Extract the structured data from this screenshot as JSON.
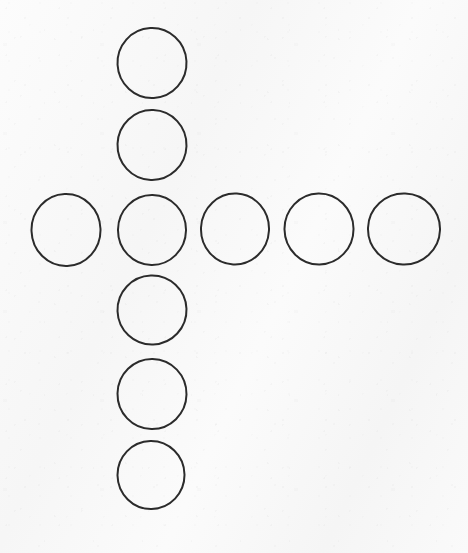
{
  "image": {
    "title": "Circles arranged in a cross",
    "description": "Hand-drawn diagram of nine open circles forming a plus / cross shape on lightly textured white paper",
    "width": 468,
    "height": 553,
    "background_color": "#fafafa",
    "stroke_color": "#2b2b2b",
    "stroke_width": 2
  },
  "chart_data": {
    "type": "scatter",
    "title": "Circles arranged in a cross",
    "xlabel": "",
    "ylabel": "",
    "xlim": [
      0,
      468
    ],
    "ylim": [
      0,
      553
    ],
    "grid": false,
    "legend": "none",
    "marker": "open-circle",
    "units": "pixels",
    "note": "Six circles form a vertical column; five circles form a horizontal row; they share the circle at (152, 230).",
    "counts": {
      "total_circles": 9,
      "vertical_column_circles": 6,
      "horizontal_row_circles": 5,
      "shared_intersection_circles": 1
    },
    "series": [
      {
        "name": "vertical-column",
        "points": [
          {
            "label": "column-1",
            "x": 152,
            "y": 63,
            "diameter": 69
          },
          {
            "label": "column-2",
            "x": 152,
            "y": 145,
            "diameter": 69
          },
          {
            "label": "column-3-intersection",
            "x": 152,
            "y": 230,
            "diameter": 69
          },
          {
            "label": "column-4",
            "x": 152,
            "y": 310,
            "diameter": 69
          },
          {
            "label": "column-5",
            "x": 152,
            "y": 394,
            "diameter": 69
          },
          {
            "label": "column-6",
            "x": 151,
            "y": 475,
            "diameter": 67
          }
        ]
      },
      {
        "name": "horizontal-row",
        "points": [
          {
            "label": "row-1",
            "x": 66,
            "y": 230,
            "diameter": 69
          },
          {
            "label": "row-2-intersection",
            "x": 152,
            "y": 230,
            "diameter": 69
          },
          {
            "label": "row-3",
            "x": 235,
            "y": 229,
            "diameter": 68
          },
          {
            "label": "row-4",
            "x": 319,
            "y": 229,
            "diameter": 69
          },
          {
            "label": "row-5",
            "x": 404,
            "y": 229,
            "diameter": 72
          }
        ]
      }
    ]
  },
  "circles": [
    {
      "name": "circle-column-top",
      "cx": 152,
      "cy": 63,
      "rx": 34.5,
      "ry": 35.0,
      "rot": -3
    },
    {
      "name": "circle-column-upper",
      "cx": 152,
      "cy": 145,
      "rx": 34.5,
      "ry": 35.0,
      "rot": 2
    },
    {
      "name": "circle-row-far-left",
      "cx": 66,
      "cy": 230,
      "rx": 34.5,
      "ry": 36.0,
      "rot": -2
    },
    {
      "name": "circle-center-intersection",
      "cx": 152,
      "cy": 230,
      "rx": 34.0,
      "ry": 35.0,
      "rot": 1
    },
    {
      "name": "circle-row-middle-right",
      "cx": 235,
      "cy": 229,
      "rx": 34.0,
      "ry": 35.5,
      "rot": 3
    },
    {
      "name": "circle-row-right",
      "cx": 319,
      "cy": 229,
      "rx": 34.5,
      "ry": 35.5,
      "rot": -1
    },
    {
      "name": "circle-row-far-right",
      "cx": 404,
      "cy": 229,
      "rx": 36.0,
      "ry": 35.5,
      "rot": 2
    },
    {
      "name": "circle-column-lower",
      "cx": 152,
      "cy": 310,
      "rx": 34.5,
      "ry": 34.5,
      "rot": -2
    },
    {
      "name": "circle-column-lower-2",
      "cx": 152,
      "cy": 394,
      "rx": 34.5,
      "ry": 35.0,
      "rot": 1
    },
    {
      "name": "circle-column-bottom",
      "cx": 151,
      "cy": 475,
      "rx": 33.5,
      "ry": 34.0,
      "rot": -1
    }
  ]
}
